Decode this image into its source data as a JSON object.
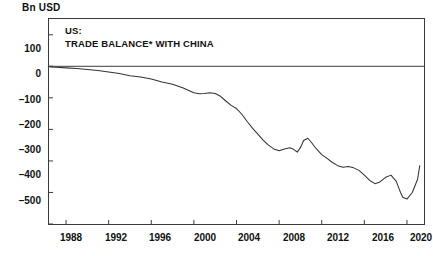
{
  "chart_data": {
    "type": "line",
    "title": "US:\nTRADE BALANCE* WITH CHINA",
    "title_line1": "US:",
    "title_line2": "TRADE BALANCE* WITH CHINA",
    "unit_label": "Bn USD",
    "xlabel": "",
    "ylabel": "Bn USD",
    "xlim": [
      1986.4,
      2021.6
    ],
    "ylim": [
      -500,
      150
    ],
    "ytick_values": [
      100,
      0,
      -100,
      -200,
      -300,
      -400,
      -500
    ],
    "ytick_labels": [
      "100",
      "0",
      "–100",
      "–200",
      "–300",
      "–400",
      "–500"
    ],
    "xtick_values": [
      1988,
      1992,
      1996,
      2000,
      2004,
      2008,
      2012,
      2016,
      2020
    ],
    "xtick_labels": [
      "1988",
      "1992",
      "1996",
      "2000",
      "2004",
      "2008",
      "2012",
      "2016",
      "2020"
    ],
    "grid": false,
    "zero_line": true,
    "legend": "none",
    "line_color": "#333333",
    "frame_color": "#3a3a3a",
    "series": [
      {
        "name": "US trade balance with China",
        "x": [
          1986.5,
          1987,
          1988,
          1989,
          1990,
          1991,
          1992,
          1993,
          1994,
          1995,
          1996,
          1997,
          1998,
          1999,
          2000,
          2000.5,
          2001,
          2001.5,
          2002,
          2002.5,
          2003,
          2003.5,
          2004,
          2004.5,
          2005,
          2005.5,
          2006,
          2006.5,
          2007,
          2007.5,
          2008,
          2008.5,
          2009,
          2009.3,
          2009.7,
          2010,
          2010.3,
          2010.7,
          2011,
          2011.5,
          2012,
          2012.5,
          2013,
          2013.5,
          2014,
          2014.5,
          2015,
          2015.5,
          2016,
          2016.5,
          2017,
          2017.4,
          2018,
          2018.5,
          2019,
          2019.3,
          2019.6,
          2020,
          2020.5,
          2021,
          2021.2
        ],
        "y": [
          -2,
          -3,
          -5,
          -7,
          -10,
          -13,
          -18,
          -23,
          -30,
          -34,
          -40,
          -50,
          -57,
          -69,
          -84,
          -87,
          -86,
          -84,
          -86,
          -95,
          -110,
          -124,
          -134,
          -152,
          -175,
          -196,
          -215,
          -234,
          -250,
          -262,
          -268,
          -262,
          -258,
          -262,
          -272,
          -258,
          -235,
          -228,
          -240,
          -262,
          -280,
          -292,
          -305,
          -315,
          -320,
          -318,
          -322,
          -330,
          -345,
          -362,
          -372,
          -368,
          -352,
          -345,
          -365,
          -392,
          -415,
          -421,
          -400,
          -358,
          -315
        ]
      }
    ],
    "annotations": [
      "*"
    ]
  },
  "footnote_marker": "*"
}
